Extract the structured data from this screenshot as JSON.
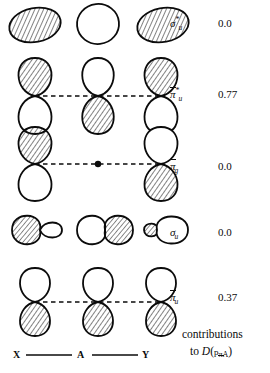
{
  "figure": {
    "title_caption_line1": "contributions",
    "title_caption_line2_prefix": "to",
    "title_caption_symbol_D": "D",
    "title_caption_symbol_open": "(",
    "title_caption_symbol_p": "p",
    "title_caption_symbol_sub": "πA",
    "title_caption_symbol_close": ")",
    "axis": {
      "left_label": "X",
      "center_label": "A",
      "right_label": "Y"
    },
    "rows": [
      {
        "id": "row-sigma-u-star",
        "symbol_base": "σ",
        "symbol_overbar": false,
        "symbol_star": "*",
        "symbol_sub": "u",
        "value": "0.0",
        "orbital_type": "s-lobes",
        "lobes": [
          "hatched",
          "open",
          "hatched"
        ],
        "has_dashed_connector": false,
        "has_center_node_dot": false
      },
      {
        "id": "row-pi-bar-u-star",
        "symbol_base": "π",
        "symbol_overbar": true,
        "symbol_star": "*",
        "symbol_sub": "u",
        "value": "0.77",
        "orbital_type": "p-vertical",
        "lobes": [
          "top-hatched",
          "bottom-hatched",
          "top-hatched"
        ],
        "has_dashed_connector": true,
        "has_center_node_dot": false
      },
      {
        "id": "row-pi-bar-g",
        "symbol_base": "π",
        "symbol_overbar": true,
        "symbol_star": "",
        "symbol_sub": "g",
        "value": "0.0",
        "orbital_type": "p-vertical",
        "lobes": [
          "top-hatched",
          "none",
          "bottom-hatched"
        ],
        "has_dashed_connector": true,
        "has_center_node_dot": true
      },
      {
        "id": "row-sigma-u",
        "symbol_base": "σ",
        "symbol_overbar": false,
        "symbol_star": "",
        "symbol_sub": "u",
        "value": "0.0",
        "orbital_type": "p-horizontal",
        "lobes": [
          "left-hatched-large",
          "right-hatched-large",
          "left-hatched-small"
        ],
        "has_dashed_connector": false,
        "has_center_node_dot": false
      },
      {
        "id": "row-pi-bar-u",
        "symbol_base": "π",
        "symbol_overbar": true,
        "symbol_star": "",
        "symbol_sub": "u",
        "value": "0.37",
        "orbital_type": "p-vertical",
        "lobes": [
          "bottom-hatched",
          "bottom-hatched",
          "bottom-hatched"
        ],
        "has_dashed_connector": true,
        "has_center_node_dot": false
      }
    ],
    "colors": {
      "ink": "#0b0b0b",
      "background": "#ffffff",
      "hatch": "#1a1a1a"
    }
  }
}
